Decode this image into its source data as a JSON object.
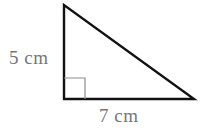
{
  "figure": {
    "type": "right-triangle-diagram",
    "background_color": "#ffffff",
    "stroke_color": "#111111",
    "stroke_width": 2.4,
    "right_angle_mark": {
      "name": "right-angle-marker",
      "color": "#8d8d90",
      "stroke_width": 1.2,
      "size_px": 21,
      "present": true
    },
    "vertices": {
      "apex": {
        "x": 64,
        "y": 5
      },
      "right_angle": {
        "x": 64,
        "y": 99
      },
      "base_right": {
        "x": 194,
        "y": 99
      }
    },
    "sides": [
      {
        "name": "vertical-leg",
        "from": "apex",
        "to": "right_angle",
        "label": "5 cm"
      },
      {
        "name": "horizontal-leg",
        "from": "right_angle",
        "to": "base_right",
        "label": "7 cm"
      },
      {
        "name": "hypotenuse",
        "from": "apex",
        "to": "base_right",
        "label": ""
      }
    ]
  },
  "labels": {
    "text_color": "#76767a",
    "vertical": {
      "value": "5 cm",
      "measure": 5,
      "unit": "cm",
      "side": "vertical-leg"
    },
    "horizontal": {
      "value": "7 cm",
      "measure": 7,
      "unit": "cm",
      "side": "horizontal-leg"
    }
  }
}
